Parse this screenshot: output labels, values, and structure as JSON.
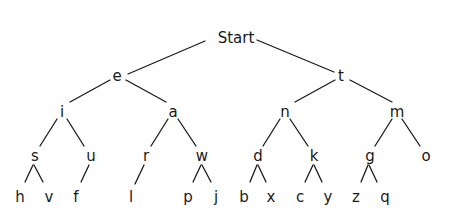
{
  "diagram": {
    "type": "tree",
    "root": "Start",
    "nodes": [
      {
        "id": "start",
        "label": "Start",
        "x": 236,
        "y": 38
      },
      {
        "id": "e",
        "label": "e",
        "x": 117,
        "y": 76
      },
      {
        "id": "t",
        "label": "t",
        "x": 341,
        "y": 76
      },
      {
        "id": "i",
        "label": "i",
        "x": 62,
        "y": 112
      },
      {
        "id": "a",
        "label": "a",
        "x": 173,
        "y": 112
      },
      {
        "id": "n",
        "label": "n",
        "x": 285,
        "y": 112
      },
      {
        "id": "m",
        "label": "m",
        "x": 397,
        "y": 112
      },
      {
        "id": "s",
        "label": "s",
        "x": 35,
        "y": 156
      },
      {
        "id": "u",
        "label": "u",
        "x": 91,
        "y": 156
      },
      {
        "id": "r",
        "label": "r",
        "x": 146,
        "y": 156
      },
      {
        "id": "w",
        "label": "w",
        "x": 202,
        "y": 156
      },
      {
        "id": "d",
        "label": "d",
        "x": 258,
        "y": 156
      },
      {
        "id": "k",
        "label": "k",
        "x": 314,
        "y": 156
      },
      {
        "id": "g",
        "label": "g",
        "x": 370,
        "y": 156
      },
      {
        "id": "o",
        "label": "o",
        "x": 426,
        "y": 156
      },
      {
        "id": "h",
        "label": "h",
        "x": 20,
        "y": 197
      },
      {
        "id": "v",
        "label": "v",
        "x": 49,
        "y": 197
      },
      {
        "id": "f",
        "label": "f",
        "x": 76,
        "y": 197
      },
      {
        "id": "l",
        "label": "l",
        "x": 131,
        "y": 197
      },
      {
        "id": "p",
        "label": "p",
        "x": 188,
        "y": 197
      },
      {
        "id": "j",
        "label": "j",
        "x": 216,
        "y": 197
      },
      {
        "id": "b",
        "label": "b",
        "x": 244,
        "y": 197
      },
      {
        "id": "x",
        "label": "x",
        "x": 271,
        "y": 197
      },
      {
        "id": "c",
        "label": "c",
        "x": 300,
        "y": 197
      },
      {
        "id": "y",
        "label": "y",
        "x": 328,
        "y": 197
      },
      {
        "id": "z",
        "label": "z",
        "x": 356,
        "y": 197
      },
      {
        "id": "q",
        "label": "q",
        "x": 385,
        "y": 197
      }
    ],
    "edges": [
      {
        "from": "start",
        "to": "e",
        "x1": 205,
        "y1": 41,
        "x2": 128,
        "y2": 74
      },
      {
        "from": "start",
        "to": "t",
        "x1": 257,
        "y1": 40,
        "x2": 334,
        "y2": 72
      },
      {
        "from": "e",
        "to": "i",
        "x1": 110,
        "y1": 80,
        "x2": 70,
        "y2": 102
      },
      {
        "from": "e",
        "to": "a",
        "x1": 126,
        "y1": 80,
        "x2": 166,
        "y2": 102
      },
      {
        "from": "t",
        "to": "n",
        "x1": 335,
        "y1": 80,
        "x2": 295,
        "y2": 102
      },
      {
        "from": "t",
        "to": "m",
        "x1": 350,
        "y1": 80,
        "x2": 392,
        "y2": 102
      },
      {
        "from": "i",
        "to": "s",
        "x1": 57,
        "y1": 119,
        "x2": 40,
        "y2": 146
      },
      {
        "from": "i",
        "to": "u",
        "x1": 67,
        "y1": 119,
        "x2": 84,
        "y2": 146
      },
      {
        "from": "a",
        "to": "r",
        "x1": 168,
        "y1": 119,
        "x2": 151,
        "y2": 146
      },
      {
        "from": "a",
        "to": "w",
        "x1": 178,
        "y1": 119,
        "x2": 196,
        "y2": 146
      },
      {
        "from": "n",
        "to": "d",
        "x1": 280,
        "y1": 119,
        "x2": 263,
        "y2": 146
      },
      {
        "from": "n",
        "to": "k",
        "x1": 290,
        "y1": 119,
        "x2": 308,
        "y2": 146
      },
      {
        "from": "m",
        "to": "g",
        "x1": 392,
        "y1": 119,
        "x2": 375,
        "y2": 146
      },
      {
        "from": "m",
        "to": "o",
        "x1": 402,
        "y1": 119,
        "x2": 420,
        "y2": 146
      },
      {
        "from": "s",
        "to": "h",
        "x1": 33,
        "y1": 165,
        "x2": 25,
        "y2": 182
      },
      {
        "from": "s",
        "to": "v",
        "x1": 34,
        "y1": 165,
        "x2": 43,
        "y2": 182
      },
      {
        "from": "u",
        "to": "f",
        "x1": 89,
        "y1": 165,
        "x2": 81,
        "y2": 182
      },
      {
        "from": "r",
        "to": "l",
        "x1": 144,
        "y1": 165,
        "x2": 135,
        "y2": 184
      },
      {
        "from": "w",
        "to": "p",
        "x1": 201,
        "y1": 165,
        "x2": 193,
        "y2": 182
      },
      {
        "from": "w",
        "to": "j",
        "x1": 202,
        "y1": 165,
        "x2": 211,
        "y2": 182
      },
      {
        "from": "d",
        "to": "b",
        "x1": 257,
        "y1": 165,
        "x2": 250,
        "y2": 182
      },
      {
        "from": "d",
        "to": "x",
        "x1": 258,
        "y1": 165,
        "x2": 266,
        "y2": 182
      },
      {
        "from": "k",
        "to": "c",
        "x1": 313,
        "y1": 165,
        "x2": 305,
        "y2": 182
      },
      {
        "from": "k",
        "to": "y",
        "x1": 314,
        "y1": 165,
        "x2": 322,
        "y2": 182
      },
      {
        "from": "g",
        "to": "z",
        "x1": 368,
        "y1": 165,
        "x2": 361,
        "y2": 182
      },
      {
        "from": "g",
        "to": "q",
        "x1": 369,
        "y1": 165,
        "x2": 377,
        "y2": 182
      }
    ]
  }
}
